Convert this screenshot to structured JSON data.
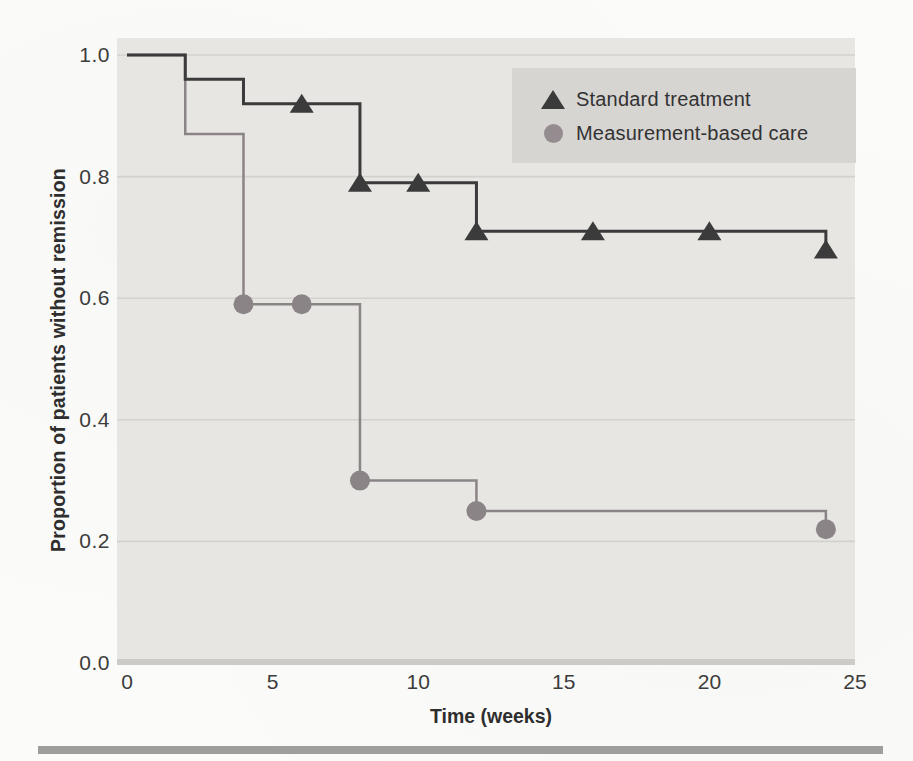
{
  "figure_type": "kaplan-meier-survival-plot",
  "chart_data": {
    "type": "line",
    "subtype": "step-function-survival-curves",
    "title": "",
    "xlabel": "Time (weeks)",
    "ylabel": "Proportion of patients without remission",
    "xlim": [
      0,
      25
    ],
    "ylim": [
      0.0,
      1.0
    ],
    "grid": "faint horizontal gridlines at each y tick",
    "plot_background": "#e7e6e3",
    "xticks": {
      "values": [
        0,
        5,
        10,
        15,
        20,
        25
      ],
      "labels": [
        "0",
        "5",
        "10",
        "15",
        "20",
        "25"
      ]
    },
    "yticks": {
      "values": [
        0.0,
        0.2,
        0.4,
        0.6,
        0.8,
        1.0
      ],
      "labels": [
        "0.0",
        "0.2",
        "0.4",
        "0.6",
        "0.8",
        "1.0"
      ]
    },
    "legend": {
      "position": "top-right-inside",
      "background": "#d6d5d2",
      "items": [
        {
          "label": "Standard treatment",
          "marker": "triangle",
          "color": "#3b3b3b"
        },
        {
          "label": "Measurement-based care",
          "marker": "circle",
          "color": "#948c8e"
        }
      ]
    },
    "series": [
      {
        "name": "Standard treatment",
        "marker": "triangle",
        "color": "#3b3b3b",
        "line_width": 3,
        "step_points": [
          [
            0,
            1.0
          ],
          [
            2,
            0.96
          ],
          [
            4,
            0.92
          ],
          [
            8,
            0.79
          ],
          [
            12,
            0.71
          ],
          [
            24,
            0.68
          ]
        ],
        "marker_points": [
          [
            6,
            0.92
          ],
          [
            8,
            0.79
          ],
          [
            10,
            0.79
          ],
          [
            12,
            0.71
          ],
          [
            16,
            0.71
          ],
          [
            20,
            0.71
          ],
          [
            24,
            0.68
          ]
        ]
      },
      {
        "name": "Measurement-based care",
        "marker": "circle",
        "color": "#8b8486",
        "line_width": 2.5,
        "step_points": [
          [
            0,
            1.0
          ],
          [
            2,
            0.87
          ],
          [
            4,
            0.59
          ],
          [
            8,
            0.3
          ],
          [
            12,
            0.25
          ],
          [
            24,
            0.22
          ]
        ],
        "marker_points": [
          [
            4,
            0.59
          ],
          [
            6,
            0.59
          ],
          [
            8,
            0.3
          ],
          [
            12,
            0.25
          ],
          [
            24,
            0.22
          ]
        ]
      }
    ]
  },
  "colors": {
    "paper": "#fbfbf9",
    "plot_bg": "#e7e6e3",
    "gridline": "#d3d2cf",
    "baseline_band": "#cccbc8",
    "series_dark": "#3b3b3b",
    "series_gray": "#8b8486",
    "legend_bg": "#d6d5d2",
    "tick_text": "#3c3c3c",
    "divider_bar": "#9e9e9c"
  }
}
